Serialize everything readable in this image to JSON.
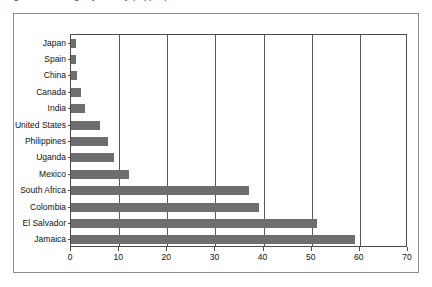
{
  "caption": {
    "clipped_text": "Figure: Percentage by country (clipped)"
  },
  "chart_data": {
    "type": "bar",
    "orientation": "horizontal",
    "title": "",
    "subtitle": "",
    "xlabel": "",
    "ylabel": "",
    "xlim": [
      0,
      70
    ],
    "xticks": [
      0,
      10,
      20,
      30,
      40,
      50,
      60,
      70
    ],
    "xtick_labels": [
      "0",
      "10",
      "20",
      "30",
      "40",
      "50",
      "60",
      "70"
    ],
    "grid": true,
    "grid_axis": "x",
    "legend": null,
    "bar_color": "#6e6e6e",
    "axis_color": "#4a4a4a",
    "frame_color": "#8c8c8c",
    "categories": [
      "Japan",
      "Spain",
      "China",
      "Canada",
      "India",
      "United States",
      "Philippines",
      "Uganda",
      "Mexico",
      "South Africa",
      "Colombia",
      "El Salvador",
      "Jamaica"
    ],
    "values": [
      1,
      1,
      1.2,
      2,
      3,
      6,
      7.7,
      9,
      12,
      37,
      39,
      51,
      59
    ]
  }
}
